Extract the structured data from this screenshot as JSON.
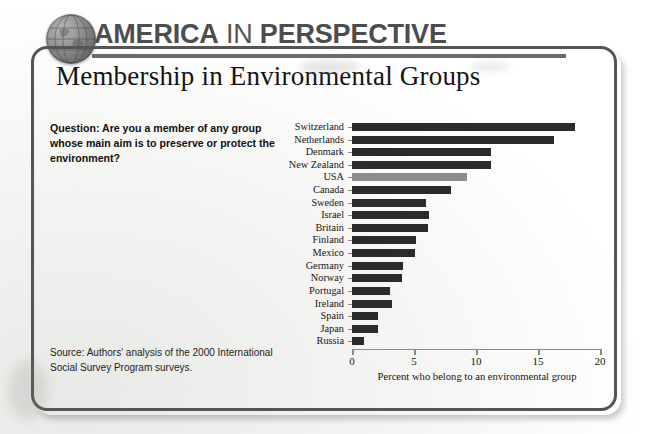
{
  "masthead": {
    "word1": "AMERICA",
    "word2": "IN",
    "word3": "PERSPECTIVE",
    "globe_icon": "globe-icon"
  },
  "chart": {
    "title": "Membership in Environmental Groups",
    "question_label": "Question:",
    "question_text": "Are you a member of any group whose main aim is to preserve or protect the environment?",
    "source": "Source: Authors' analysis of the 2000 International Social Survey Program surveys.",
    "highlight_color": "#8d8d8d",
    "bar_color": "#2b2b2b"
  },
  "chart_data": {
    "type": "bar",
    "orientation": "horizontal",
    "title": "Membership in Environmental Groups",
    "xlabel": "Percent who belong to an environmental group",
    "ylabel": "",
    "xlim": [
      0,
      20
    ],
    "xticks": [
      0,
      5,
      10,
      15,
      20
    ],
    "xtick_labels": [
      "0",
      "5",
      "10",
      "15",
      "20"
    ],
    "grid": false,
    "legend": false,
    "highlight_category": "USA",
    "categories": [
      "Switzerland",
      "Netherlands",
      "Denmark",
      "New Zealand",
      "USA",
      "Canada",
      "Sweden",
      "Israel",
      "Britain",
      "Finland",
      "Mexico",
      "Germany",
      "Norway",
      "Portugal",
      "Ireland",
      "Spain",
      "Japan",
      "Russia"
    ],
    "values": [
      18.0,
      16.3,
      11.2,
      11.2,
      9.3,
      8.0,
      6.0,
      6.2,
      6.1,
      5.2,
      5.1,
      4.1,
      4.0,
      3.1,
      3.2,
      2.1,
      2.1,
      1.0
    ]
  }
}
